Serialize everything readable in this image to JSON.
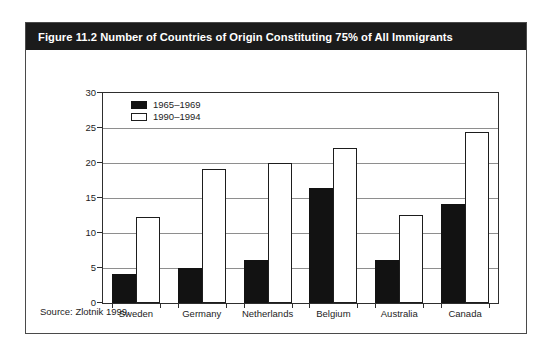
{
  "figure": {
    "title": "Figure 11.2 Number of Countries of Origin Constituting 75% of All Immigrants",
    "source_note": "Source: Zlotnik 1999.",
    "title_bar_color": "#1b1b1b",
    "title_text_color": "#ffffff"
  },
  "chart_data": {
    "type": "bar",
    "title": "Figure 11.2 Number of Countries of Origin Constituting 75% of All Immigrants",
    "xlabel": "",
    "ylabel": "",
    "ylim": [
      0,
      30
    ],
    "yticks": [
      0,
      5,
      10,
      15,
      20,
      25,
      30
    ],
    "grid": true,
    "legend_position": "top-left inside plot",
    "categories": [
      "Sweden",
      "Germany",
      "Netherlands",
      "Belgium",
      "Australia",
      "Canada"
    ],
    "series": [
      {
        "name": "1965–1969",
        "color": "#121212",
        "fill": "solid-black",
        "values": [
          4.2,
          5.0,
          6.1,
          16.4,
          6.1,
          14.2
        ]
      },
      {
        "name": "1990–1994",
        "color": "#ffffff",
        "fill": "white-outlined",
        "values": [
          12.3,
          19.2,
          20.0,
          22.1,
          12.6,
          24.5
        ]
      }
    ]
  }
}
